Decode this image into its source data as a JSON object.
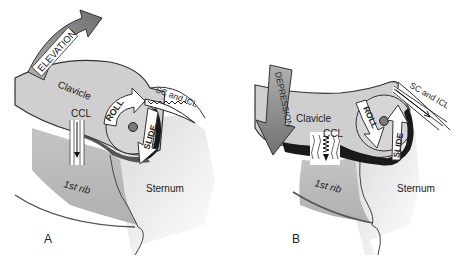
{
  "figure": {
    "panels": [
      {
        "id": "A",
        "panel_label": "A",
        "motion_label": "ELEVATION",
        "clavicle_label": "Clavicle",
        "ccl_label": "CCL",
        "roll_label": "ROLL",
        "slide_label": "SLIDE",
        "ligament_label": "SC and ICL",
        "rib_label": "1st rib",
        "sternum_label": "Sternum"
      },
      {
        "id": "B",
        "panel_label": "B",
        "motion_label": "DEPRESSION",
        "clavicle_label": "Clavicle",
        "ccl_label": "CCL",
        "roll_label": "ROLL",
        "slide_label": "SLIDE",
        "ligament_label": "SC and ICL",
        "rib_label": "1st rib",
        "sternum_label": "Sternum"
      }
    ],
    "colors": {
      "bone_light": "#d4d4d4",
      "bone_mid": "#bdbdbd",
      "rib_dark": "#a8a8a8",
      "joint_dark": "#1a1a1a",
      "arrow_gray": "#8a8a8a",
      "axis_dot": "#7a7a7a",
      "outline": "#333333"
    }
  }
}
